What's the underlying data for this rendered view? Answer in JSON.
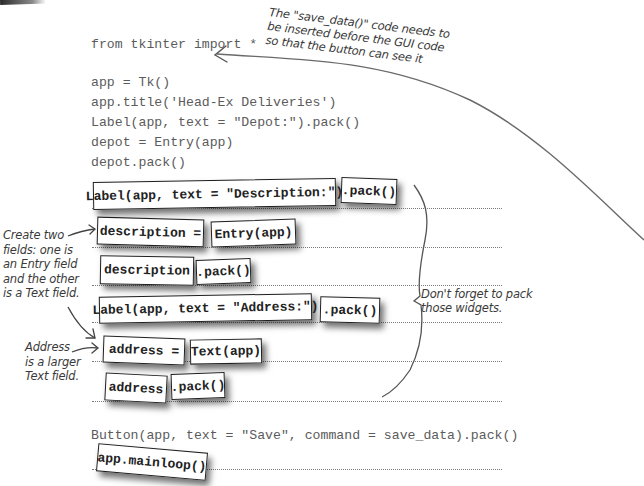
{
  "code": {
    "lines": [
      "from tkinter import *",
      "app = Tk()",
      "app.title('Head-Ex Deliveries')",
      "Label(app, text = \"Depot:\").pack()",
      "depot = Entry(app)",
      "depot.pack()",
      "Button(app, text = \"Save\", command = save_data).pack()"
    ]
  },
  "magnets": {
    "label_description": "Label(app, text = \"Description:\")",
    "label_description_pack": ".pack()",
    "description_assign": "description =",
    "entry_app": "Entry(app)",
    "description_var": "description",
    "description_pack": ".pack()",
    "label_address": "Label(app, text = \"Address:\")",
    "label_address_pack": ".pack()",
    "address_assign": "address =",
    "text_app": "Text(app)",
    "address_var": "address",
    "address_pack": ".pack()",
    "mainloop": "app.mainloop()"
  },
  "annotations": {
    "save_data_note": "The \"save_data()\" code needs to\nbe inserted before the GUI code\nso that the button can see it",
    "create_two_fields": "Create two\nfields: one is\nan Entry field\nand the other\nis a Text field.",
    "address_larger": "Address\nis a larger\nText field.",
    "pack_widgets": "Don't forget to pack\nthose widgets."
  }
}
